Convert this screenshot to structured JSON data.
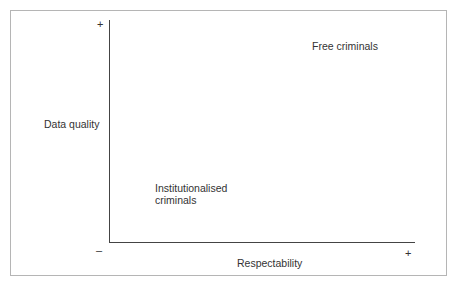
{
  "diagram": {
    "y_axis": {
      "label": "Data quality",
      "max_symbol": "+",
      "min_symbol": "–"
    },
    "x_axis": {
      "label": "Respectability",
      "max_symbol": "+"
    },
    "quadrant_labels": [
      {
        "text": "Free criminals",
        "position": "top-right"
      },
      {
        "text_line1": "Institutionalised",
        "text_line2": "criminals",
        "position": "bottom-left"
      }
    ],
    "colors": {
      "axis": "#444444",
      "frame": "#b5b5b5",
      "text": "#333333"
    }
  }
}
